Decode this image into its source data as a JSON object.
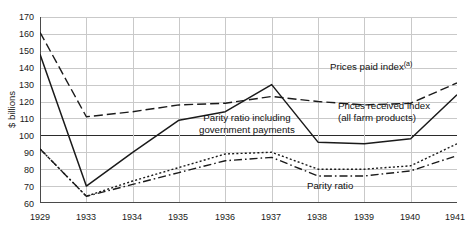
{
  "chart_data": {
    "type": "line",
    "title": "",
    "xlabel": "",
    "ylabel": "$ billions",
    "x": [
      "1929",
      "1933",
      "1934",
      "1935",
      "1936",
      "1937",
      "1938",
      "1939",
      "1940",
      "1941"
    ],
    "xtick_labels": [
      "1929",
      "1933",
      "1934",
      "1935",
      "1936",
      "1937",
      "1938",
      "1939",
      "1940",
      "1941"
    ],
    "ytick_labels": [
      "170",
      "160",
      "150",
      "140",
      "130",
      "120",
      "110",
      "100",
      "90",
      "80",
      "70",
      "60"
    ],
    "ylim": [
      60,
      170
    ],
    "ytick_step": 10,
    "grid": true,
    "legend": "annotations-inline",
    "reference_line": 100,
    "series": [
      {
        "name": "Prices paid index (a)",
        "style": "dashed",
        "color": "#1a1a1a",
        "values": [
          161,
          111,
          114,
          118,
          119,
          123,
          120,
          118,
          119,
          131
        ]
      },
      {
        "name": "Prices received index (all farm products)",
        "style": "solid",
        "color": "#1a1a1a",
        "values": [
          148,
          70,
          90,
          109,
          114,
          130,
          96,
          95,
          98,
          124
        ]
      },
      {
        "name": "Parity ratio including government payments",
        "style": "dotted",
        "color": "#1a1a1a",
        "values": [
          92,
          64,
          73,
          81,
          89,
          90,
          80,
          80,
          82,
          95
        ]
      },
      {
        "name": "Parity ratio",
        "style": "dash-dot",
        "color": "#1a1a1a",
        "values": [
          92,
          64,
          71,
          78,
          85,
          87,
          76,
          76,
          79,
          88
        ]
      }
    ],
    "annotations": [
      {
        "name": "prices-paid-index",
        "text": "Prices paid index",
        "superscript": "(a)"
      },
      {
        "name": "prices-received-index",
        "line1": "Prices received index",
        "line2": "(all farm products)"
      },
      {
        "name": "parity-ratio-including-government-payments",
        "line1": "Parity ratio including",
        "line2": "government payments"
      },
      {
        "name": "parity-ratio",
        "text": "Parity ratio"
      }
    ]
  }
}
